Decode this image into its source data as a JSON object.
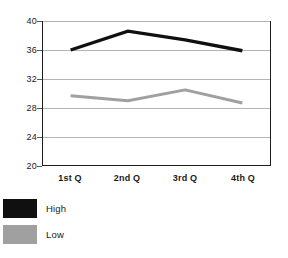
{
  "chart_data": {
    "type": "line",
    "title": "",
    "subtitle": "",
    "xlabel": "",
    "ylabel": "",
    "categories": [
      "1st Q",
      "2nd Q",
      "3rd Q",
      "4th Q"
    ],
    "series": [
      {
        "name": "High",
        "color": "#101010",
        "values": [
          36.0,
          38.6,
          37.4,
          35.9
        ]
      },
      {
        "name": "Low",
        "color": "#a0a0a0",
        "values": [
          29.7,
          29.0,
          30.5,
          28.7
        ]
      }
    ],
    "ylim": [
      20,
      40
    ],
    "yticks": [
      20,
      24,
      28,
      32,
      36,
      40
    ],
    "ytick_labels": [
      "20",
      "24",
      "28",
      "32",
      "36",
      "40"
    ],
    "xlim_categories": 4,
    "grid": "horizontal",
    "legend_position": "below-left",
    "plot_background": "#ffffff",
    "grid_color": "#b4b4b4",
    "frame_color": "#1c1c1c"
  },
  "legend": {
    "items": [
      {
        "label": "High",
        "color": "#101010"
      },
      {
        "label": "Low",
        "color": "#a0a0a0"
      }
    ]
  }
}
